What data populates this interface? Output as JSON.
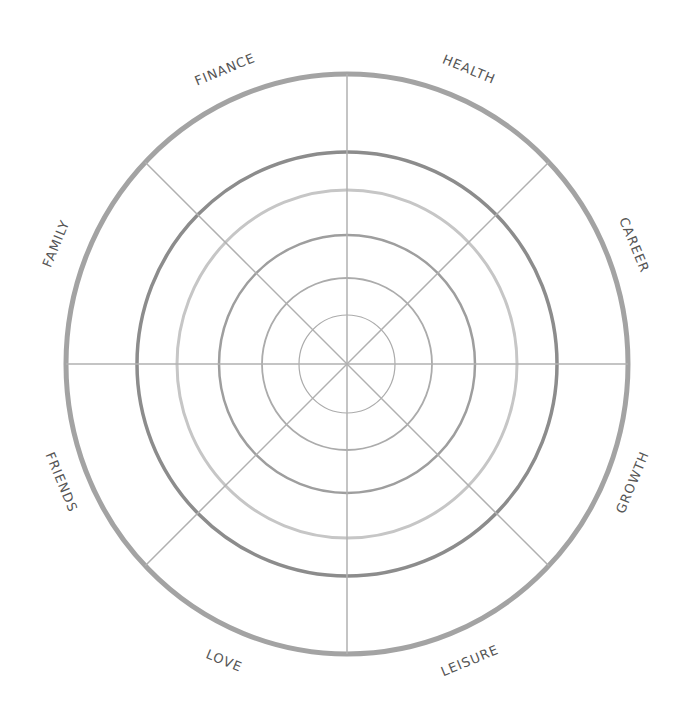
{
  "center": {
    "x": 347,
    "y": 364
  },
  "colors": {
    "outer_ring": "#a3a3a3",
    "ring_dark": "#8c8c8c",
    "ring_light": "#c6c6c6",
    "ring_mid": "#9e9e9e",
    "ring_thin": "#ababab",
    "spokes": "#b0b0b0",
    "label": "#555555"
  },
  "rings": [
    {
      "rx": 281,
      "ry": 290,
      "width": 5,
      "color_key": "outer_ring"
    },
    {
      "rx": 210,
      "ry": 212,
      "width": 3.5,
      "color_key": "ring_dark"
    },
    {
      "rx": 170,
      "ry": 174,
      "width": 3,
      "color_key": "ring_light"
    },
    {
      "rx": 128,
      "ry": 129,
      "width": 2.5,
      "color_key": "ring_mid"
    },
    {
      "rx": 85,
      "ry": 86,
      "width": 1.8,
      "color_key": "ring_thin"
    },
    {
      "rx": 48,
      "ry": 49,
      "width": 1.2,
      "color_key": "ring_thin"
    }
  ],
  "segments": [
    {
      "label": "HEALTH",
      "angle": 22.5,
      "radius": 318
    },
    {
      "label": "CAREER",
      "angle": 67.5,
      "radius": 310
    },
    {
      "label": "GROWTH",
      "angle": 112.5,
      "radius": 310
    },
    {
      "label": "LEISURE",
      "angle": 157.5,
      "radius": 322
    },
    {
      "label": "LOVE",
      "angle": 202.5,
      "radius": 322
    },
    {
      "label": "FRIENDS",
      "angle": 247.5,
      "radius": 310
    },
    {
      "label": "FAMILY",
      "angle": 292.5,
      "radius": 314
    },
    {
      "label": "FINANCE",
      "angle": 337.5,
      "radius": 318
    }
  ]
}
